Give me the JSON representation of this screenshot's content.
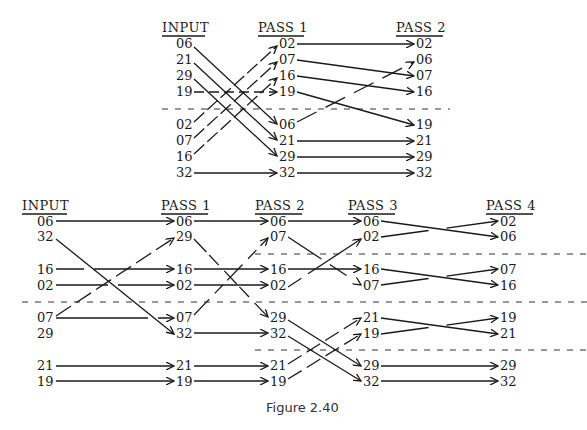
{
  "caption": "Figure 2.40",
  "colors": {
    "ink": "#1a1a1a",
    "background": "#ffffff"
  },
  "top_network": {
    "headers": [
      "INPUT",
      "PASS 1",
      "PASS 2"
    ],
    "columns": {
      "input": [
        "06",
        "21",
        "29",
        "19",
        "02",
        "07",
        "16",
        "32"
      ],
      "pass1": [
        "02",
        "07",
        "16",
        "19",
        "06",
        "21",
        "29",
        "32"
      ],
      "pass2": [
        "02",
        "06",
        "07",
        "16",
        "19",
        "21",
        "29",
        "32"
      ]
    }
  },
  "bottom_network": {
    "headers": [
      "INPUT",
      "PASS 1",
      "PASS 2",
      "PASS 3",
      "PASS 4"
    ],
    "columns": {
      "input": [
        "06",
        "32",
        "16",
        "02",
        "07",
        "29",
        "21",
        "19"
      ],
      "pass1": [
        "06",
        "29",
        "16",
        "02",
        "07",
        "32",
        "21",
        "19"
      ],
      "pass2": [
        "06",
        "07",
        "16",
        "02",
        "29",
        "32",
        "21",
        "19"
      ],
      "pass3": [
        "06",
        "02",
        "16",
        "07",
        "21",
        "19",
        "29",
        "32"
      ],
      "pass4": [
        "02",
        "06",
        "07",
        "16",
        "19",
        "21",
        "29",
        "32"
      ]
    }
  }
}
